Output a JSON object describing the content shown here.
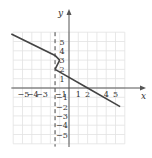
{
  "chart_data": {
    "type": "line",
    "title": "",
    "xlabel": "x",
    "ylabel": "y",
    "xlim": [
      -6,
      6
    ],
    "ylim": [
      -6,
      6
    ],
    "grid": true,
    "x_ticks": [
      "-5",
      "-4",
      "-3",
      "-1",
      "1",
      "2",
      "4",
      "5"
    ],
    "y_ticks": [
      "5",
      "4",
      "3",
      "2",
      "1",
      "-1",
      "-2",
      "-3",
      "-4",
      "-5"
    ],
    "asymptote": {
      "x": -1.5,
      "style": "dashed"
    },
    "series": [
      {
        "name": "left piece",
        "points": [
          [
            -6.2,
            5.8
          ],
          [
            -1.5,
            3.5
          ],
          [
            -1,
            3
          ]
        ]
      },
      {
        "name": "right piece",
        "points": [
          [
            -1.5,
            2
          ],
          [
            2,
            0
          ],
          [
            5.5,
            -2
          ]
        ]
      },
      {
        "name": "connector",
        "points": [
          [
            -1,
            3
          ],
          [
            -1.5,
            2
          ]
        ]
      }
    ]
  },
  "labels": {
    "x_axis": "x",
    "y_axis": "y"
  }
}
